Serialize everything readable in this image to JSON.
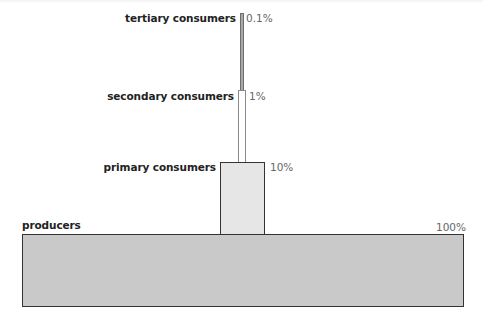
{
  "diagram": {
    "title": "",
    "levels": [
      {
        "name": "tertiary consumers",
        "percent_label": "0.1%"
      },
      {
        "name": "secondary consumers",
        "percent_label": "1%"
      },
      {
        "name": "primary consumers",
        "percent_label": "10%"
      },
      {
        "name": "producers",
        "percent_label": "100%"
      }
    ],
    "colors": {
      "producers_fill": "#c9c9c9",
      "primary_fill": "#e6e6e6",
      "secondary_fill": "#ffffff",
      "tertiary_fill": "#a8a8a8",
      "border": "#333333"
    }
  },
  "chart_data": {
    "type": "bar",
    "title": "",
    "orientation": "stacked-pyramid",
    "categories": [
      "producers",
      "primary consumers",
      "secondary consumers",
      "tertiary consumers"
    ],
    "values": [
      100,
      10,
      1,
      0.1
    ],
    "value_labels": [
      "100%",
      "10%",
      "1%",
      "0.1%"
    ],
    "xlabel": "",
    "ylabel": "",
    "grid": false,
    "legend": null
  }
}
